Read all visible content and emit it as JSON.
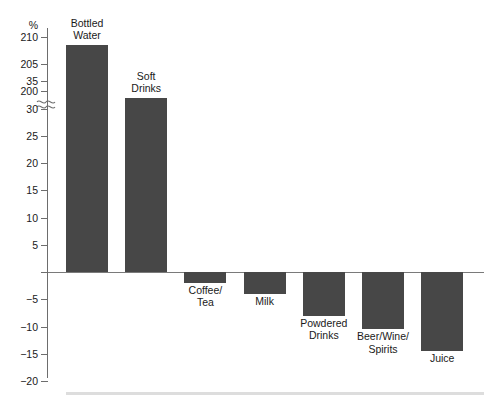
{
  "chart_data": {
    "type": "bar",
    "title": "",
    "xlabel": "",
    "ylabel": "%",
    "categories": [
      "Bottled\nWater",
      "Soft\nDrinks",
      "Coffee/\nTea",
      "Milk",
      "Powdered\nDrinks",
      "Beer/Wine/\nSpirits",
      "Juice"
    ],
    "values": [
      208.5,
      32,
      -2,
      -4,
      -8,
      -10.5,
      -14.5
    ],
    "grid": false,
    "legend": null,
    "axis_break": true,
    "axis_break_between": [
      35,
      200
    ],
    "ylim": [
      -20,
      210
    ],
    "ytick_labels_upper": [
      "210",
      "205",
      "200"
    ],
    "ytick_labels_lower": [
      "35",
      "30",
      "25",
      "20",
      "15",
      "10",
      "5",
      "",
      "-5",
      "-10",
      "-15",
      "-20"
    ],
    "bar_color": "#474747",
    "axis_color": "#6d6d6d"
  },
  "axis": {
    "unit_label": "%",
    "upper_ticks": [
      {
        "label": "210",
        "value": 210
      },
      {
        "label": "205",
        "value": 205
      },
      {
        "label": "200",
        "value": 200
      }
    ],
    "lower_ticks": [
      {
        "label": "35",
        "value": 35
      },
      {
        "label": "30",
        "value": 30
      },
      {
        "label": "25",
        "value": 25
      },
      {
        "label": "20",
        "value": 20
      },
      {
        "label": "15",
        "value": 15
      },
      {
        "label": "10",
        "value": 10
      },
      {
        "label": "5",
        "value": 5
      },
      {
        "label": "",
        "value": 0
      },
      {
        "label": "−5",
        "value": -5
      },
      {
        "label": "−10",
        "value": -10
      },
      {
        "label": "−15",
        "value": -15
      },
      {
        "label": "−20",
        "value": -20
      }
    ]
  },
  "bars": [
    {
      "name": "bottled-water",
      "label": "Bottled\nWater",
      "value": 208.5
    },
    {
      "name": "soft-drinks",
      "label": "Soft\nDrinks",
      "value": 32
    },
    {
      "name": "coffee-tea",
      "label": "Coffee/\nTea",
      "value": -2
    },
    {
      "name": "milk",
      "label": "Milk",
      "value": -4
    },
    {
      "name": "powdered-drinks",
      "label": "Powdered\nDrinks",
      "value": -8
    },
    {
      "name": "beer-wine-spirits",
      "label": "Beer/Wine/\nSpirits",
      "value": -10.5
    },
    {
      "name": "juice",
      "label": "Juice",
      "value": -14.5
    }
  ],
  "artifacts": {
    "top_fragment": " "
  }
}
